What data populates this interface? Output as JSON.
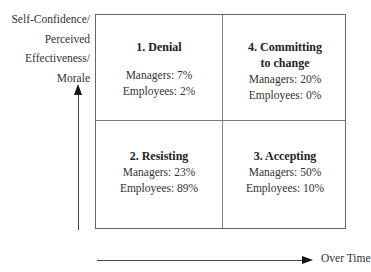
{
  "y_axis": {
    "label_lines": [
      "Self-Confidence/",
      "Perceived",
      "Effectiveness/",
      "Morale"
    ]
  },
  "x_axis": {
    "label": "Over Time"
  },
  "quadrants": {
    "top_left": {
      "title": "1. Denial",
      "managers": "Managers: 7%",
      "employees": "Employees: 2%"
    },
    "top_right": {
      "title_lines": [
        "4. Committing",
        "to change"
      ],
      "managers": "Managers: 20%",
      "employees": "Employees: 0%"
    },
    "bottom_left": {
      "title": "2. Resisting",
      "managers": "Managers: 23%",
      "employees": "Employees: 89%"
    },
    "bottom_right": {
      "title": "3. Accepting",
      "managers": "Managers: 50%",
      "employees": "Employees: 10%"
    }
  },
  "chart_data": {
    "type": "table",
    "title": "",
    "xlabel": "Over Time",
    "ylabel": "Self-Confidence/Perceived Effectiveness/Morale",
    "stages": [
      {
        "stage": 1,
        "name": "Denial",
        "position": "top-left",
        "managers_pct": 7,
        "employees_pct": 2
      },
      {
        "stage": 2,
        "name": "Resisting",
        "position": "bottom-left",
        "managers_pct": 23,
        "employees_pct": 89
      },
      {
        "stage": 3,
        "name": "Accepting",
        "position": "bottom-right",
        "managers_pct": 50,
        "employees_pct": 10
      },
      {
        "stage": 4,
        "name": "Committing to change",
        "position": "top-right",
        "managers_pct": 20,
        "employees_pct": 0
      }
    ]
  }
}
